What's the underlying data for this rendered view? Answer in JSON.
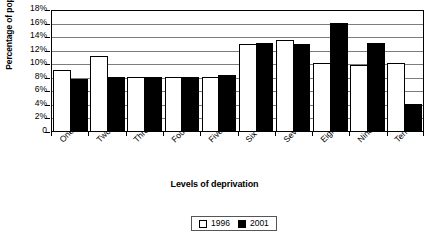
{
  "chart_data": {
    "type": "bar",
    "title": "",
    "xlabel": "Levels of deprivation",
    "ylabel": "Percentage of population",
    "categories": [
      "One",
      "Two",
      "Three",
      "Four",
      "Five",
      "Six",
      "Seven",
      "Eight",
      "Nine",
      "Ten"
    ],
    "series": [
      {
        "name": "1996",
        "color": "#ffffff",
        "values": [
          9.0,
          11.0,
          8.0,
          8.0,
          8.0,
          12.8,
          13.5,
          10.0,
          9.8,
          10.0
        ]
      },
      {
        "name": "2001",
        "color": "#000000",
        "values": [
          7.7,
          8.0,
          7.9,
          8.0,
          8.3,
          13.0,
          12.9,
          16.0,
          13.0,
          4.0
        ]
      }
    ],
    "ylim": [
      0,
      18
    ],
    "yticks": [
      "0",
      "2%",
      "4%",
      "6%",
      "8%",
      "10%",
      "12%",
      "14%",
      "16%",
      "18%"
    ],
    "ytick_values": [
      0,
      2,
      4,
      6,
      8,
      10,
      12,
      14,
      16,
      18
    ],
    "grid": true,
    "grid_axis": "y",
    "legend_position": "bottom-center",
    "legend_entries": [
      "1996",
      "2001"
    ]
  },
  "legend": {
    "entries": [
      {
        "label": "1996",
        "swatch": "white-square-icon"
      },
      {
        "label": "2001",
        "swatch": "black-square-icon"
      }
    ]
  }
}
